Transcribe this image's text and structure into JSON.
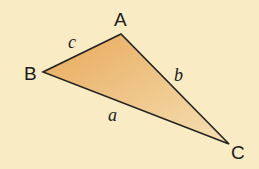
{
  "diagram": {
    "type": "triangle",
    "colors": {
      "background": "#f9ecc4",
      "fill_start": "#e8ac5e",
      "fill_end": "#f5dcae",
      "stroke": "#222222"
    },
    "vertices": [
      {
        "label": "A",
        "x": 121,
        "y": 34
      },
      {
        "label": "B",
        "x": 43,
        "y": 72
      },
      {
        "label": "C",
        "x": 229,
        "y": 144
      }
    ],
    "sides": [
      {
        "label": "c",
        "between": "A-B"
      },
      {
        "label": "b",
        "between": "A-C"
      },
      {
        "label": "a",
        "between": "B-C"
      }
    ]
  }
}
